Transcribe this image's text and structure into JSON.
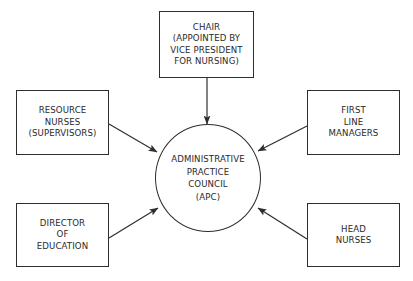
{
  "diagram": {
    "type": "hub-and-spoke organizational diagram",
    "center": {
      "id": "apc",
      "label": "ADMINISTRATIVE\nPRACTICE\nCOUNCIL\n(APC)"
    },
    "nodes": [
      {
        "id": "chair",
        "label": "CHAIR\n(APPOINTED BY\nVICE PRESIDENT\nFOR NURSING)",
        "position": "top"
      },
      {
        "id": "resource-nurses",
        "label": "RESOURCE\nNURSES\n(SUPERVISORS)",
        "position": "upper-left"
      },
      {
        "id": "first-line-managers",
        "label": "FIRST\nLINE\nMANAGERS",
        "position": "upper-right"
      },
      {
        "id": "director-of-education",
        "label": "DIRECTOR\nOF\nEDUCATION",
        "position": "lower-left"
      },
      {
        "id": "head-nurses",
        "label": "HEAD\nNURSES",
        "position": "lower-right"
      }
    ],
    "edges": [
      {
        "from": "chair",
        "to": "apc",
        "arrow": "to"
      },
      {
        "from": "resource-nurses",
        "to": "apc",
        "arrow": "to"
      },
      {
        "from": "first-line-managers",
        "to": "apc",
        "arrow": "to"
      },
      {
        "from": "director-of-education",
        "to": "apc",
        "arrow": "to"
      },
      {
        "from": "head-nurses",
        "to": "apc",
        "arrow": "to"
      }
    ],
    "colors": {
      "line": "#2e2e2e",
      "text": "#2a2a2a",
      "background": "#ffffff"
    }
  }
}
